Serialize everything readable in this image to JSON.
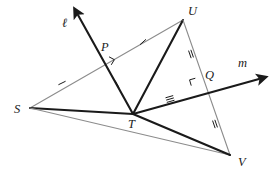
{
  "figure": {
    "type": "geometry-diagram",
    "background_color": "#ffffff",
    "gray_color": "#8c8c8c",
    "dark_color": "#1a1a1a",
    "labels": {
      "line_l": "ℓ",
      "line_m": "m",
      "point_s": "S",
      "point_t": "T",
      "point_u": "U",
      "point_v": "V",
      "point_p": "P",
      "point_q": "Q"
    },
    "points": [
      {
        "name": "S",
        "label": "S",
        "x": 30,
        "y": 108
      },
      {
        "name": "T",
        "label": "T",
        "x": 133,
        "y": 114
      },
      {
        "name": "U",
        "label": "U",
        "x": 183,
        "y": 20
      },
      {
        "name": "V",
        "label": "V",
        "x": 230,
        "y": 155
      },
      {
        "name": "P",
        "label": "P",
        "x": 106,
        "y": 62
      },
      {
        "name": "Q",
        "label": "Q",
        "x": 197,
        "y": 84
      }
    ],
    "label_positions": [
      {
        "name": "S",
        "x": 14,
        "y": 113
      },
      {
        "name": "T",
        "x": 128,
        "y": 128
      },
      {
        "name": "U",
        "x": 188,
        "y": 15
      },
      {
        "name": "V",
        "x": 238,
        "y": 166
      },
      {
        "name": "P",
        "x": 101,
        "y": 51
      },
      {
        "name": "Q",
        "x": 205,
        "y": 79
      },
      {
        "name": "l",
        "x": 62,
        "y": 27
      },
      {
        "name": "m",
        "x": 238,
        "y": 67
      }
    ],
    "segments": [
      {
        "name": "S-U",
        "from": "S",
        "to": "U",
        "color": "gray",
        "weight": "thin"
      },
      {
        "name": "S-T",
        "from": "S",
        "to": "T",
        "color": "dark",
        "weight": "thick"
      },
      {
        "name": "S-V",
        "from": "S",
        "to": "V",
        "color": "gray",
        "weight": "thin"
      },
      {
        "name": "U-T",
        "from": "U",
        "to": "T",
        "color": "dark",
        "weight": "thick"
      },
      {
        "name": "U-V",
        "from": "U",
        "to": "V",
        "color": "gray",
        "weight": "thin"
      },
      {
        "name": "T-V",
        "from": "T",
        "to": "V",
        "color": "dark",
        "weight": "thick"
      }
    ],
    "rays": [
      {
        "name": "ray-l",
        "label": "ℓ",
        "from_x": 133,
        "from_y": 114,
        "to_x": 78,
        "to_y": 15,
        "color": "dark",
        "arrow": true,
        "passes_through": "P"
      },
      {
        "name": "ray-m",
        "label": "m",
        "from_x": 133,
        "from_y": 114,
        "to_x": 259,
        "to_y": 79,
        "color": "dark",
        "arrow": true,
        "passes_through": "Q"
      }
    ],
    "right_angle_marks": [
      {
        "name": "right-angle-at-P",
        "at": "P",
        "x": 106,
        "y": 62
      },
      {
        "name": "right-angle-at-Q",
        "at": "Q",
        "x": 197,
        "y": 84
      }
    ],
    "tick_marks": [
      {
        "name": "tick-SP",
        "segment": "S-P",
        "count": 1,
        "x": 62,
        "y": 83,
        "angle": -26
      },
      {
        "name": "tick-PU",
        "segment": "P-U",
        "count": 1,
        "x": 143,
        "y": 42,
        "angle": -42
      },
      {
        "name": "tick-PT",
        "segment": "P-T",
        "count": 1,
        "x": 117,
        "y": 84,
        "angle": 61
      },
      {
        "name": "tick-UQ",
        "segment": "U-Q",
        "count": 2,
        "x": 191,
        "y": 54,
        "angle": 71
      },
      {
        "name": "tick-QV",
        "segment": "Q-V",
        "count": 2,
        "x": 215,
        "y": 124,
        "angle": 71
      },
      {
        "name": "tick-TQ",
        "segment": "T-Q",
        "count": 3,
        "x": 170,
        "y": 99,
        "angle": -16
      }
    ]
  }
}
